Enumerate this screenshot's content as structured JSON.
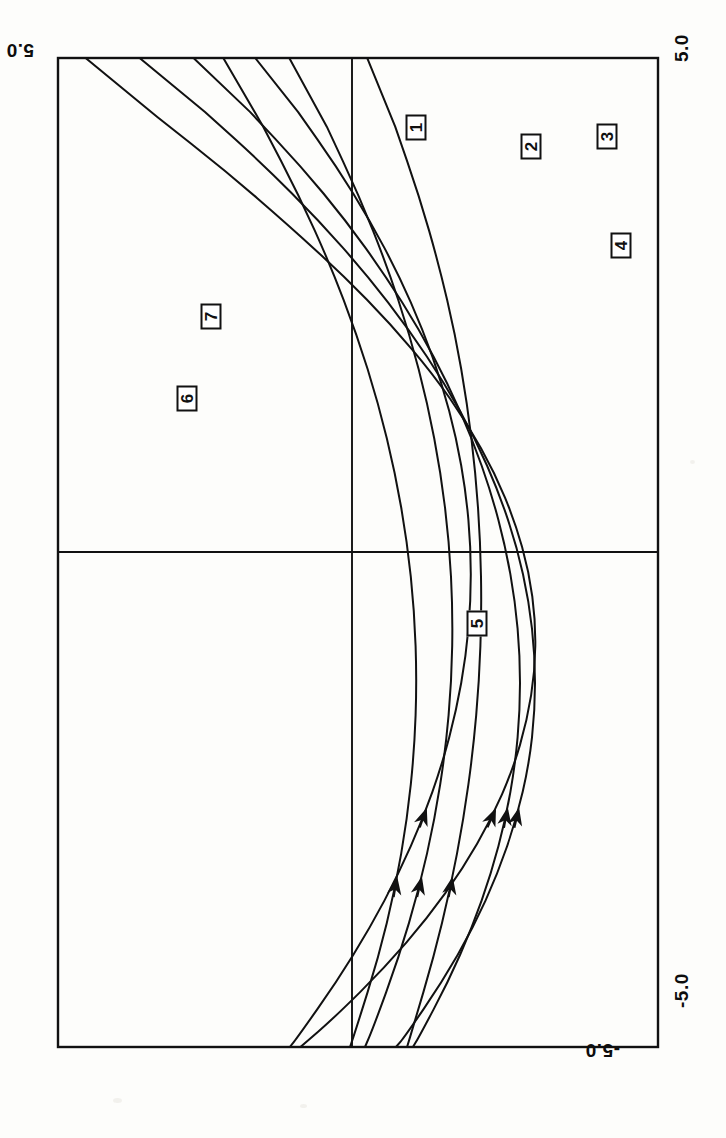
{
  "figure": {
    "kind": "scanned-phase-portrait",
    "orientation_note": "page-rotated-90-ccw",
    "background_color": "#fdfdfb",
    "ink_color": "#111111",
    "frame": {
      "x": 58,
      "y": 58,
      "width": 600,
      "height": 989
    },
    "origin_px": {
      "x": 352,
      "y": 552
    }
  },
  "axis_labels": [
    {
      "name": "y-max",
      "text": "5.0",
      "x": 34,
      "y": 60,
      "rotation": 180
    },
    {
      "name": "x-max",
      "text": "5.0",
      "x": 672,
      "y": 62,
      "rotation": -90
    },
    {
      "name": "x-min",
      "text": "-5.0",
      "x": 672,
      "y": 1008,
      "rotation": -90
    },
    {
      "name": "y-min",
      "text": "-5.0",
      "x": 620,
      "y": 1060,
      "rotation": 180
    }
  ],
  "curve_labels": [
    {
      "id": "1",
      "text": "1",
      "x": 403,
      "y": 117
    },
    {
      "id": "2",
      "text": "2",
      "x": 518,
      "y": 136
    },
    {
      "id": "3",
      "text": "3",
      "x": 594,
      "y": 126
    },
    {
      "id": "4",
      "text": "4",
      "x": 608,
      "y": 235
    },
    {
      "id": "5",
      "text": "5",
      "x": 464,
      "y": 613
    },
    {
      "id": "6",
      "text": "6",
      "x": 174,
      "y": 388
    },
    {
      "id": "7",
      "text": "7",
      "x": 198,
      "y": 306
    }
  ],
  "chart_data": {
    "type": "line",
    "title": "",
    "xlabel": "",
    "ylabel": "",
    "xlim": [
      -5.0,
      5.0
    ],
    "ylim": [
      -5.0,
      5.0
    ],
    "grid": false,
    "legend": "inline-boxed-numbers",
    "axis_tick_labels": {
      "x": [
        "-5.0",
        "5.0"
      ],
      "y": [
        "-5.0",
        "5.0"
      ]
    },
    "annotations": [
      "1",
      "2",
      "3",
      "4",
      "5",
      "6",
      "7"
    ],
    "series": [
      {
        "name": "1",
        "label": "1",
        "arrow_direction": "toward-decreasing-x",
        "points": [
          [
            -5.0,
            4.45
          ],
          [
            -4.4,
            3.25
          ],
          [
            -3.85,
            2.1
          ],
          [
            -3.3,
            1.05
          ],
          [
            -2.8,
            0.15
          ],
          [
            -2.3,
            -0.65
          ],
          [
            -1.8,
            -1.35
          ],
          [
            -1.3,
            -1.92
          ],
          [
            -0.8,
            -2.38
          ],
          [
            -0.3,
            -2.72
          ],
          [
            0.2,
            -2.95
          ],
          [
            0.7,
            -3.06
          ],
          [
            1.2,
            -3.05
          ],
          [
            1.7,
            -2.92
          ],
          [
            2.2,
            -2.68
          ],
          [
            2.7,
            -2.32
          ],
          [
            3.2,
            -1.85
          ],
          [
            3.7,
            -1.26
          ],
          [
            4.2,
            -0.55
          ],
          [
            4.7,
            0.28
          ],
          [
            5.0,
            0.85
          ]
        ]
      },
      {
        "name": "2",
        "label": "2",
        "arrow_direction": "toward-decreasing-x",
        "points": [
          [
            -5.0,
            3.55
          ],
          [
            -4.45,
            2.45
          ],
          [
            -3.9,
            1.45
          ],
          [
            -3.35,
            0.55
          ],
          [
            -2.8,
            -0.25
          ],
          [
            -2.25,
            -0.95
          ],
          [
            -1.7,
            -1.55
          ],
          [
            -1.15,
            -2.05
          ],
          [
            -0.6,
            -2.45
          ],
          [
            -0.05,
            -2.75
          ],
          [
            0.5,
            -2.95
          ],
          [
            1.05,
            -3.05
          ],
          [
            1.6,
            -3.05
          ],
          [
            2.15,
            -2.95
          ],
          [
            2.7,
            -2.74
          ],
          [
            3.25,
            -2.43
          ],
          [
            3.8,
            -2.02
          ],
          [
            4.35,
            -1.5
          ],
          [
            4.9,
            -0.88
          ],
          [
            5.0,
            -0.74
          ]
        ]
      },
      {
        "name": "3",
        "label": "3",
        "arrow_direction": "toward-decreasing-x",
        "points": [
          [
            -5.0,
            2.65
          ],
          [
            -4.45,
            1.7
          ],
          [
            -3.9,
            0.85
          ],
          [
            -3.35,
            0.1
          ],
          [
            -2.8,
            -0.55
          ],
          [
            -2.25,
            -1.12
          ],
          [
            -1.7,
            -1.6
          ],
          [
            -1.15,
            -2.0
          ],
          [
            -0.6,
            -2.32
          ],
          [
            -0.05,
            -2.56
          ],
          [
            0.5,
            -2.72
          ],
          [
            1.05,
            -2.8
          ],
          [
            1.6,
            -2.8
          ],
          [
            2.15,
            -2.72
          ],
          [
            2.7,
            -2.56
          ],
          [
            3.25,
            -2.32
          ],
          [
            3.8,
            -2.0
          ],
          [
            4.35,
            -1.6
          ],
          [
            4.9,
            -1.12
          ],
          [
            5.0,
            -1.02
          ]
        ]
      },
      {
        "name": "4",
        "label": "4",
        "arrow_direction": "toward-decreasing-x",
        "points": [
          [
            -5.0,
            1.62
          ],
          [
            -4.45,
            0.9
          ],
          [
            -3.9,
            0.26
          ],
          [
            -3.35,
            -0.3
          ],
          [
            -2.8,
            -0.78
          ],
          [
            -2.25,
            -1.18
          ],
          [
            -1.7,
            -1.5
          ],
          [
            -1.15,
            -1.74
          ],
          [
            -0.6,
            -1.9
          ],
          [
            -0.05,
            -1.98
          ],
          [
            0.5,
            -1.98
          ],
          [
            1.05,
            -1.9
          ],
          [
            1.6,
            -1.74
          ],
          [
            2.15,
            -1.5
          ],
          [
            2.7,
            -1.18
          ],
          [
            3.25,
            -0.78
          ],
          [
            3.8,
            -0.3
          ],
          [
            4.35,
            0.26
          ],
          [
            4.9,
            0.9
          ],
          [
            5.0,
            1.03
          ]
        ]
      },
      {
        "name": "5",
        "label": "5",
        "arrow_direction": "toward-decreasing-x",
        "points": [
          [
            -5.0,
            -0.25
          ],
          [
            -4.3,
            -0.72
          ],
          [
            -3.6,
            -1.12
          ],
          [
            -2.9,
            -1.45
          ],
          [
            -2.2,
            -1.72
          ],
          [
            -1.5,
            -1.92
          ],
          [
            -0.8,
            -2.06
          ],
          [
            -0.1,
            -2.14
          ],
          [
            0.6,
            -2.16
          ],
          [
            1.3,
            -2.12
          ],
          [
            2.0,
            -2.02
          ],
          [
            2.7,
            -1.86
          ],
          [
            3.4,
            -1.64
          ],
          [
            4.1,
            -1.36
          ],
          [
            4.8,
            -1.02
          ],
          [
            5.0,
            -0.92
          ]
        ]
      },
      {
        "name": "6",
        "label": "6",
        "arrow_direction": "toward-decreasing-x",
        "points": [
          [
            -5.0,
            1.05
          ],
          [
            -4.3,
            0.42
          ],
          [
            -3.6,
            -0.12
          ],
          [
            -2.9,
            -0.58
          ],
          [
            -2.2,
            -0.96
          ],
          [
            -1.5,
            -1.26
          ],
          [
            -0.8,
            -1.48
          ],
          [
            -0.1,
            -1.62
          ],
          [
            0.6,
            -1.68
          ],
          [
            1.3,
            -1.66
          ],
          [
            2.0,
            -1.56
          ],
          [
            2.7,
            -1.38
          ],
          [
            3.4,
            -1.12
          ],
          [
            4.1,
            -0.78
          ],
          [
            4.8,
            -0.36
          ],
          [
            5.0,
            -0.22
          ]
        ]
      },
      {
        "name": "7",
        "label": "7",
        "arrow_direction": "toward-decreasing-x",
        "points": [
          [
            -5.0,
            2.15
          ],
          [
            -4.3,
            1.48
          ],
          [
            -3.6,
            0.88
          ],
          [
            -2.9,
            0.36
          ],
          [
            -2.2,
            -0.08
          ],
          [
            -1.5,
            -0.44
          ],
          [
            -0.8,
            -0.72
          ],
          [
            -0.1,
            -0.92
          ],
          [
            0.6,
            -1.04
          ],
          [
            1.3,
            -1.08
          ],
          [
            2.0,
            -1.04
          ],
          [
            2.7,
            -0.92
          ],
          [
            3.4,
            -0.72
          ],
          [
            4.1,
            -0.44
          ],
          [
            4.8,
            -0.08
          ],
          [
            5.0,
            0.03
          ]
        ]
      }
    ]
  }
}
